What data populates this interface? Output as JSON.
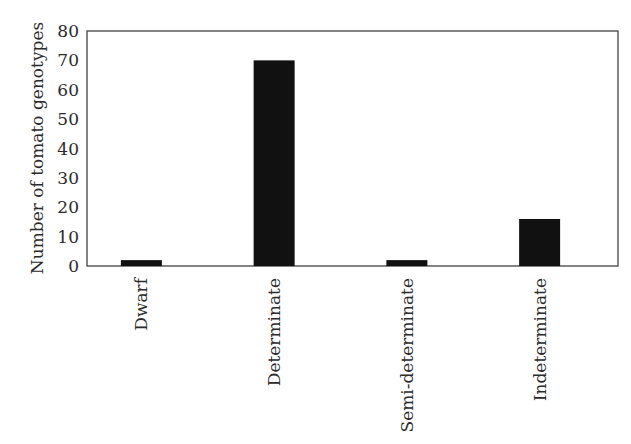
{
  "chart_data": {
    "type": "bar",
    "title": "",
    "xlabel": "",
    "ylabel": "Number of tomato genotypes",
    "categories": [
      "Dwarf",
      "Determinate",
      "Semi-determinate",
      "Indeterminate"
    ],
    "values": [
      2,
      70,
      2,
      16
    ],
    "ylim": [
      0,
      80
    ],
    "yticks": [
      0,
      10,
      20,
      30,
      40,
      50,
      60,
      70,
      80
    ],
    "grid": false,
    "legend": null,
    "bar_color": "#111111",
    "frame": "box",
    "x_tick_label_rotation": -90
  }
}
